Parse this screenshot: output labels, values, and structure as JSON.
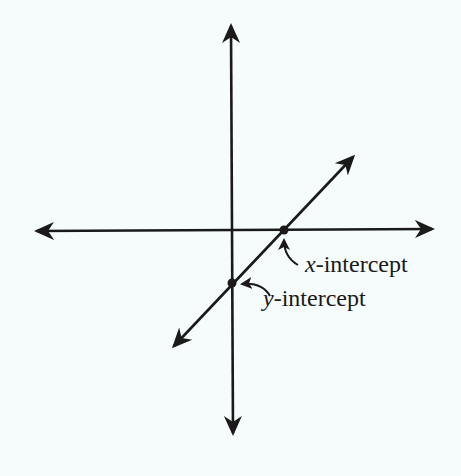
{
  "diagram": {
    "background_color": "#f6fbfc",
    "ink_color": "#1a1a1a",
    "axes": {
      "horizontal": {
        "from": [
          33,
          231
        ],
        "to": [
          436,
          229
        ],
        "arrows": "both"
      },
      "vertical": {
        "from": [
          231,
          22
        ],
        "to": [
          233,
          437
        ],
        "arrows": "both"
      }
    },
    "line": {
      "from": [
        171,
        349
      ],
      "to": [
        356,
        154
      ],
      "arrows": "both"
    },
    "points": [
      {
        "name": "x-intercept",
        "x": 284,
        "y": 230
      },
      {
        "name": "y-intercept",
        "x": 232,
        "y": 283
      }
    ],
    "labels": {
      "x_intercept": {
        "var": "x",
        "suffix": "-intercept"
      },
      "y_intercept": {
        "var": "y",
        "suffix": "-intercept"
      }
    }
  }
}
